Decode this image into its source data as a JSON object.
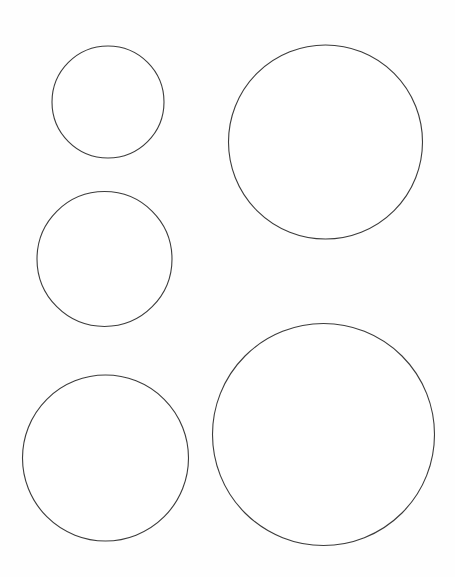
{
  "page": {
    "width": 455,
    "height": 577,
    "background_color": "#fefefe",
    "paper_color": "#ffffff"
  },
  "drawing": {
    "type": "line-drawing",
    "description": "Five unfilled outline circles of varying sizes arranged on a blank white page",
    "stroke_color": "#3c3c3c",
    "fill_color": "#ffffff",
    "stroke_width": 1.1,
    "shape_count": 5,
    "shapes": [
      {
        "id": "circle-1",
        "name": "small-circle-top-left",
        "cx": 108,
        "cy": 102,
        "r": 56,
        "stroke": "#3c3c3c",
        "stroke_width": 1.1,
        "fill": "#ffffff"
      },
      {
        "id": "circle-2",
        "name": "large-circle-top-right",
        "cx": 325.5,
        "cy": 142,
        "r": 97,
        "stroke": "#3c3c3c",
        "stroke_width": 1.1,
        "fill": "#ffffff"
      },
      {
        "id": "circle-3",
        "name": "medium-circle-middle-left",
        "cx": 104.5,
        "cy": 259,
        "r": 67.5,
        "stroke": "#3c3c3c",
        "stroke_width": 1.1,
        "fill": "#ffffff"
      },
      {
        "id": "circle-4",
        "name": "medium-large-circle-bottom-left",
        "cx": 105.5,
        "cy": 458,
        "r": 83,
        "stroke": "#3c3c3c",
        "stroke_width": 1.1,
        "fill": "#ffffff"
      },
      {
        "id": "circle-5",
        "name": "largest-circle-bottom-right",
        "cx": 323.5,
        "cy": 434.5,
        "r": 111,
        "stroke": "#3c3c3c",
        "stroke_width": 1.1,
        "fill": "#ffffff"
      }
    ]
  }
}
